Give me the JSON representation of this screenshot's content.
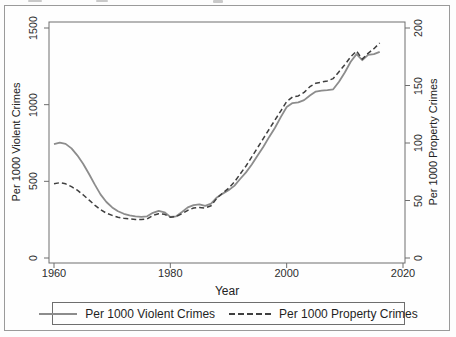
{
  "figure": {
    "background": "#fefefe",
    "border_color": "#9a9a9a",
    "axis_color": "#6e6e6e"
  },
  "chart_data": {
    "type": "line",
    "title": "",
    "xlabel": "Year",
    "x_ticks": [
      1960,
      1980,
      2000,
      2020
    ],
    "xlim": [
      1959.1,
      2020.4
    ],
    "grid": false,
    "legend_position": "bottom",
    "left_axis": {
      "label": "Per 1000 Violent Crimes",
      "ticks": [
        0,
        500,
        1000,
        1500
      ],
      "lim": [
        0,
        1500
      ]
    },
    "right_axis": {
      "label": "Per 1000 Property Crimes",
      "ticks": [
        0,
        50,
        100,
        150,
        200
      ],
      "lim": [
        0,
        200
      ]
    },
    "x": [
      1960,
      1961,
      1962,
      1963,
      1964,
      1965,
      1966,
      1967,
      1968,
      1969,
      1970,
      1971,
      1972,
      1973,
      1974,
      1975,
      1976,
      1977,
      1978,
      1979,
      1980,
      1981,
      1982,
      1983,
      1984,
      1985,
      1986,
      1987,
      1988,
      1989,
      1990,
      1991,
      1992,
      1993,
      1994,
      1995,
      1996,
      1997,
      1998,
      1999,
      2000,
      2001,
      2002,
      2003,
      2004,
      2005,
      2006,
      2007,
      2008,
      2009,
      2010,
      2011,
      2012,
      2013,
      2014,
      2015,
      2016
    ],
    "series": [
      {
        "name": "Per 1000 Violent Crimes",
        "axis": "left",
        "style": "solid",
        "color": "#8c8c8c",
        "values": [
          742,
          752,
          744,
          715,
          670,
          615,
          550,
          480,
          415,
          365,
          330,
          305,
          288,
          278,
          272,
          268,
          272,
          295,
          308,
          298,
          268,
          272,
          300,
          330,
          345,
          350,
          340,
          355,
          395,
          420,
          442,
          470,
          515,
          558,
          610,
          668,
          725,
          790,
          850,
          920,
          985,
          1010,
          1015,
          1030,
          1060,
          1085,
          1092,
          1095,
          1100,
          1150,
          1210,
          1280,
          1330,
          1290,
          1325,
          1330,
          1345
        ]
      },
      {
        "name": "Per 1000 Property Crimes",
        "axis": "right",
        "style": "dashed",
        "color": "#3f3f3f",
        "values": [
          64.5,
          65.5,
          64.5,
          62,
          59,
          55,
          50.5,
          46,
          42,
          39,
          37,
          35.5,
          34.5,
          34,
          33.5,
          33.5,
          34,
          37,
          38.5,
          38,
          35.5,
          36,
          38.5,
          41.5,
          43.5,
          44,
          43.5,
          45.5,
          52,
          56.5,
          60.5,
          66,
          73,
          80,
          88,
          96,
          104,
          112,
          120,
          128,
          136,
          140,
          141,
          144,
          149,
          152,
          153,
          154,
          156,
          162,
          168,
          175,
          180,
          173,
          178,
          182,
          187
        ]
      }
    ]
  }
}
